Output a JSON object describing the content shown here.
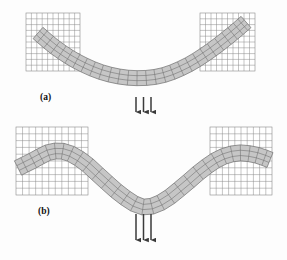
{
  "figure": {
    "background_color": "#fdfdfd",
    "panels": [
      {
        "id": "a",
        "label": "(a)",
        "label_x": 40,
        "label_y": 100,
        "caption_note": "moderate downward deflection of beam under central point loads",
        "supports": [
          {
            "name": "left-support-block",
            "x": 26,
            "y": 13,
            "width": 54,
            "height": 58,
            "grid_cols": 10,
            "grid_rows": 10,
            "fill": "#ffffff",
            "line_color": "#8a8a8a"
          },
          {
            "name": "right-support-block",
            "x": 200,
            "y": 13,
            "width": 55,
            "height": 58,
            "grid_cols": 10,
            "grid_rows": 10,
            "fill": "#ffffff",
            "line_color": "#8a8a8a"
          }
        ],
        "beam": {
          "name": "deformed-beam-mesh",
          "thickness": 15,
          "elements_along_length": 28,
          "elements_through_thickness": 3,
          "fill": "#c6c6c6",
          "line_color": "#6d6d6d",
          "centerline_points": [
            [
              38,
              33
            ],
            [
              56,
              48
            ],
            [
              78,
              62
            ],
            [
              104,
              73
            ],
            [
              132,
              78
            ],
            [
              160,
              76
            ],
            [
              186,
              66
            ],
            [
              210,
              51
            ],
            [
              232,
              34
            ],
            [
              246,
              22
            ]
          ]
        },
        "load": {
          "name": "load-arrows",
          "arrow_count": 3,
          "direction": "down",
          "x_positions": [
            136,
            143.5,
            151
          ],
          "y_start": 97,
          "y_end": 118,
          "color": "#3a3a3a"
        }
      },
      {
        "id": "b",
        "label": "(b)",
        "label_x": 38,
        "label_y": 214,
        "caption_note": "larger deflection with beam ends wrapped flat against the supports",
        "supports": [
          {
            "name": "left-support-block",
            "x": 16,
            "y": 127,
            "width": 72,
            "height": 68,
            "grid_cols": 11,
            "grid_rows": 10,
            "fill": "#ffffff",
            "line_color": "#8a8a8a"
          },
          {
            "name": "right-support-block",
            "x": 210,
            "y": 127,
            "width": 62,
            "height": 68,
            "grid_cols": 10,
            "grid_rows": 10,
            "fill": "#ffffff",
            "line_color": "#8a8a8a"
          }
        ],
        "beam": {
          "name": "deformed-beam-mesh",
          "thickness": 16,
          "elements_along_length": 30,
          "elements_through_thickness": 3,
          "fill": "#c6c6c6",
          "line_color": "#6d6d6d",
          "centerline_points": [
            [
              18,
              168
            ],
            [
              34,
              160
            ],
            [
              50,
              152
            ],
            [
              66,
              152
            ],
            [
              84,
              162
            ],
            [
              104,
              180
            ],
            [
              124,
              197
            ],
            [
              143,
              207
            ],
            [
              162,
              202
            ],
            [
              182,
              187
            ],
            [
              202,
              170
            ],
            [
              220,
              158
            ],
            [
              238,
              153
            ],
            [
              256,
              155
            ],
            [
              270,
              160
            ]
          ]
        },
        "load": {
          "name": "load-arrows",
          "arrow_count": 3,
          "direction": "down",
          "x_positions": [
            136,
            143.5,
            151
          ],
          "y_start": 214,
          "y_end": 246,
          "color": "#3a3a3a"
        }
      }
    ]
  }
}
